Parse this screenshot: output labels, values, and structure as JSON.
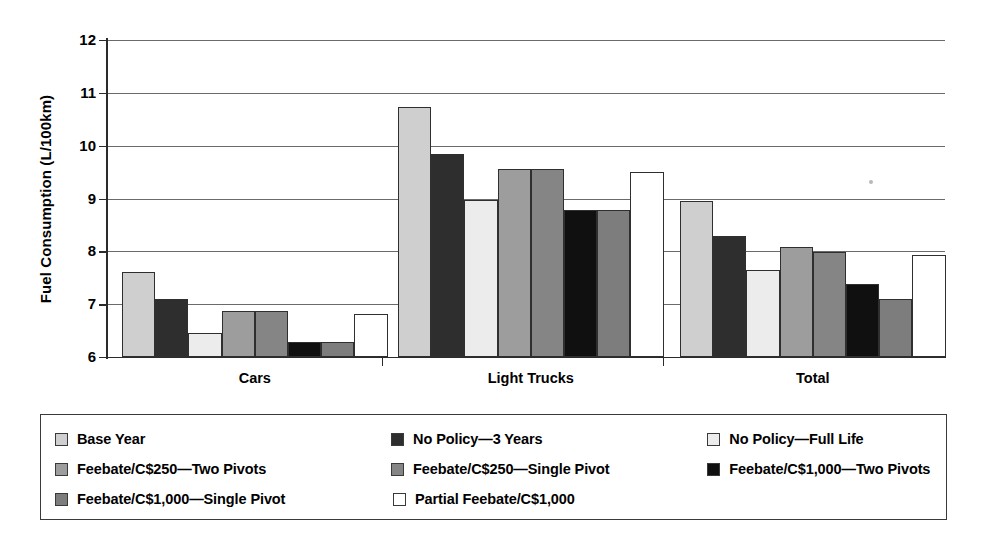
{
  "chart_data": {
    "type": "bar",
    "title": "",
    "xlabel": "",
    "ylabel": "Fuel Consumption (L/100km)",
    "ylim": [
      6,
      12
    ],
    "yticks": [
      6,
      7,
      8,
      9,
      10,
      11,
      12
    ],
    "grid": true,
    "legend_position": "bottom",
    "categories": [
      "Cars",
      "Light Trucks",
      "Total"
    ],
    "series": [
      {
        "name": "Base Year",
        "color": "#cfcfcf",
        "values": [
          7.61,
          10.73,
          8.96
        ]
      },
      {
        "name": "No Policy—3 Years",
        "color": "#2e2e2e",
        "values": [
          7.09,
          9.84,
          8.29
        ]
      },
      {
        "name": "No Policy—Full Life",
        "color": "#ececec",
        "values": [
          6.45,
          8.98,
          7.65
        ]
      },
      {
        "name": "Feebate/C$250—Two Pivots",
        "color": "#9d9d9d",
        "values": [
          6.87,
          9.56,
          8.08
        ]
      },
      {
        "name": "Feebate/C$250—Single Pivot",
        "color": "#858585",
        "values": [
          6.87,
          9.56,
          7.99
        ]
      },
      {
        "name": "Feebate/C$1,000—Two Pivots",
        "color": "#101010",
        "values": [
          6.29,
          8.79,
          7.39
        ]
      },
      {
        "name": "Feebate/C$1,000—Single Pivot",
        "color": "#7d7d7d",
        "values": [
          6.29,
          8.79,
          7.09
        ]
      },
      {
        "name": "Partial Feebate/C$1,000",
        "color": "#ffffff",
        "values": [
          6.81,
          9.51,
          7.94
        ]
      }
    ]
  },
  "axis": {
    "y_label": "Fuel Consumption (L/100km)",
    "y_tick_labels": [
      "12",
      "11",
      "10",
      "9",
      "8",
      "7",
      "6"
    ],
    "x_tick_labels": [
      "Cars",
      "Light Trucks",
      "Total"
    ]
  },
  "legend": {
    "rows": [
      [
        {
          "label": "Base Year",
          "color": "#cfcfcf"
        },
        {
          "label": "No Policy—3 Years",
          "color": "#2e2e2e"
        },
        {
          "label": "No Policy—Full Life",
          "color": "#ececec"
        }
      ],
      [
        {
          "label": "Feebate/C$250—Two Pivots",
          "color": "#9d9d9d"
        },
        {
          "label": "Feebate/C$250—Single Pivot",
          "color": "#858585"
        },
        {
          "label": "Feebate/C$1,000—Two Pivots",
          "color": "#101010"
        }
      ],
      [
        {
          "label": "Feebate/C$1,000—Single Pivot",
          "color": "#7d7d7d"
        },
        {
          "label": "Partial Feebate/C$1,000",
          "color": "#ffffff"
        }
      ]
    ]
  }
}
